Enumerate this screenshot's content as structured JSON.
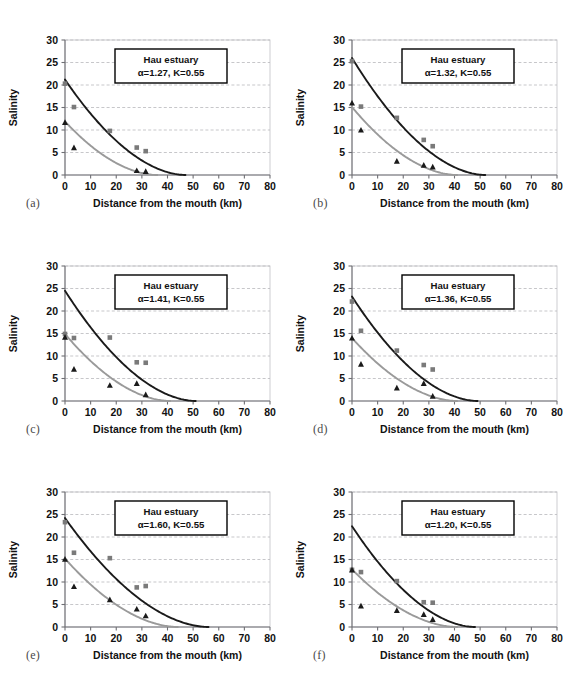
{
  "figure": {
    "title": "",
    "panel_count": 6,
    "background": "#ffffff"
  },
  "axes": {
    "xlabel": "Distance from the mouth (km)",
    "ylabel": "Salinity",
    "xticks": [
      0,
      10,
      20,
      30,
      40,
      50,
      60,
      70,
      80
    ],
    "yticks": [
      0,
      5,
      10,
      15,
      20,
      25,
      30
    ],
    "xlim": [
      0,
      80
    ],
    "ylim": [
      0,
      30
    ],
    "grid": "horizontal-dashed"
  },
  "legend": {
    "line1": "Hau estuary",
    "k_label": "K=0.55",
    "alpha_symbol": "α"
  },
  "colors": {
    "series_dark": "#1a1a1a",
    "series_light": "#9a9a9a",
    "grid": "#b9b9bc",
    "frame": "#c8c8cc",
    "axis": "#6f6f74",
    "text": "#111111"
  },
  "chart_data": [
    {
      "type": "scatter",
      "panel": "(a)",
      "title": "Hau estuary",
      "annotation": "α=1.27, K=0.55",
      "alpha": 1.27,
      "K": 0.55,
      "alpha_text": "=1.27, K=0.55",
      "xlabel": "Distance from the mouth (km)",
      "ylabel": "Salinity",
      "xlim": [
        0,
        80
      ],
      "ylim": [
        0,
        30
      ],
      "series": [
        {
          "name": "high-water slack (squares, dark)",
          "marker": "square",
          "color": "#7a7a7a",
          "points": [
            [
              0,
              20.3
            ],
            [
              3.5,
              15.1
            ],
            [
              17.5,
              9.8
            ],
            [
              28,
              6.1
            ],
            [
              31.5,
              5.3
            ]
          ]
        },
        {
          "name": "low-water slack (triangles, dark)",
          "marker": "triangle",
          "color": "#1a1a1a",
          "points": [
            [
              0,
              11.7
            ],
            [
              3.5,
              6.1
            ],
            [
              28,
              1.0
            ],
            [
              31.5,
              0.8
            ]
          ]
        }
      ],
      "curves": [
        {
          "name": "fitted-curve-dark",
          "color": "#1a1a1a",
          "s0": 21.2,
          "x_end": 47
        },
        {
          "name": "fitted-curve-light",
          "color": "#9a9a9a",
          "s0": 11.9,
          "x_end": 36
        }
      ]
    },
    {
      "type": "scatter",
      "panel": "(b)",
      "title": "Hau estuary",
      "annotation": "α=1.32, K=0.55",
      "alpha": 1.32,
      "K": 0.55,
      "alpha_text": "=1.32, K=0.55",
      "xlabel": "Distance from the mouth (km)",
      "ylabel": "Salinity",
      "xlim": [
        0,
        80
      ],
      "ylim": [
        0,
        30
      ],
      "series": [
        {
          "name": "high-water slack (squares, dark)",
          "marker": "square",
          "color": "#7a7a7a",
          "points": [
            [
              0,
              25.3
            ],
            [
              3.5,
              15.2
            ],
            [
              17.5,
              12.7
            ],
            [
              28,
              7.8
            ],
            [
              31.5,
              6.4
            ]
          ]
        },
        {
          "name": "low-water slack (triangles, dark)",
          "marker": "triangle",
          "color": "#1a1a1a",
          "points": [
            [
              0,
              16.0
            ],
            [
              3.5,
              10.0
            ],
            [
              17.5,
              3.1
            ],
            [
              28,
              2.2
            ],
            [
              31.5,
              1.8
            ]
          ]
        }
      ],
      "curves": [
        {
          "name": "fitted-curve-dark",
          "color": "#1a1a1a",
          "s0": 26.0,
          "x_end": 52
        },
        {
          "name": "fitted-curve-light",
          "color": "#9a9a9a",
          "s0": 15.1,
          "x_end": 41
        }
      ]
    },
    {
      "type": "scatter",
      "panel": "(c)",
      "title": "Hau estuary",
      "annotation": "α=1.41, K=0.55",
      "alpha": 1.41,
      "K": 0.55,
      "alpha_text": "=1.41, K=0.55",
      "xlabel": "Distance from the mouth (km)",
      "ylabel": "Salinity",
      "xlim": [
        0,
        80
      ],
      "ylim": [
        0,
        30
      ],
      "series": [
        {
          "name": "high-water slack (squares, dark)",
          "marker": "square",
          "color": "#7a7a7a",
          "points": [
            [
              0,
              14.9
            ],
            [
              3.5,
              14.0
            ],
            [
              17.5,
              14.1
            ],
            [
              28,
              8.6
            ],
            [
              31.5,
              8.5
            ]
          ]
        },
        {
          "name": "low-water slack (triangles, dark)",
          "marker": "triangle",
          "color": "#1a1a1a",
          "points": [
            [
              0,
              14.2
            ],
            [
              3.5,
              7.1
            ],
            [
              17.5,
              3.5
            ],
            [
              28,
              3.9
            ],
            [
              31.5,
              1.4
            ]
          ]
        }
      ],
      "curves": [
        {
          "name": "fitted-curve-dark",
          "color": "#1a1a1a",
          "s0": 24.5,
          "x_end": 51
        },
        {
          "name": "fitted-curve-light",
          "color": "#9a9a9a",
          "s0": 14.9,
          "x_end": 41
        }
      ]
    },
    {
      "type": "scatter",
      "panel": "(d)",
      "title": "Hau estuary",
      "annotation": "α=1.36, K=0.55",
      "alpha": 1.36,
      "K": 0.55,
      "alpha_text": "=1.36, K=0.55",
      "xlabel": "Distance from the mouth (km)",
      "ylabel": "Salinity",
      "xlim": [
        0,
        80
      ],
      "ylim": [
        0,
        30
      ],
      "series": [
        {
          "name": "high-water slack (squares, dark)",
          "marker": "square",
          "color": "#7a7a7a",
          "points": [
            [
              0,
              22.1
            ],
            [
              3.5,
              15.6
            ],
            [
              17.5,
              11.2
            ],
            [
              28,
              8.0
            ],
            [
              31.5,
              7.0
            ]
          ]
        },
        {
          "name": "low-water slack (triangles, dark)",
          "marker": "triangle",
          "color": "#1a1a1a",
          "points": [
            [
              0,
              14.0
            ],
            [
              3.5,
              8.2
            ],
            [
              17.5,
              2.9
            ],
            [
              28,
              3.9
            ],
            [
              31.5,
              1.1
            ]
          ]
        }
      ],
      "curves": [
        {
          "name": "fitted-curve-dark",
          "color": "#1a1a1a",
          "s0": 23.2,
          "x_end": 49
        },
        {
          "name": "fitted-curve-light",
          "color": "#9a9a9a",
          "s0": 14.0,
          "x_end": 41
        }
      ]
    },
    {
      "type": "scatter",
      "panel": "(e)",
      "title": "Hau estuary",
      "annotation": "α=1.60, K=0.55",
      "alpha": 1.6,
      "K": 0.55,
      "alpha_text": "=1.60, K=0.55",
      "xlabel": "Distance from the mouth (km)",
      "ylabel": "Salinity",
      "xlim": [
        0,
        80
      ],
      "ylim": [
        0,
        30
      ],
      "series": [
        {
          "name": "high-water slack (squares, dark)",
          "marker": "square",
          "color": "#7a7a7a",
          "points": [
            [
              0,
              23.3
            ],
            [
              3.5,
              16.5
            ],
            [
              17.5,
              15.3
            ],
            [
              28,
              8.8
            ],
            [
              31.5,
              9.1
            ]
          ]
        },
        {
          "name": "low-water slack (triangles, dark)",
          "marker": "triangle",
          "color": "#1a1a1a",
          "points": [
            [
              0,
              15.1
            ],
            [
              3.5,
              9.0
            ],
            [
              17.5,
              6.1
            ],
            [
              28,
              4.0
            ],
            [
              31.5,
              2.5
            ]
          ]
        }
      ],
      "curves": [
        {
          "name": "fitted-curve-dark",
          "color": "#1a1a1a",
          "s0": 24.2,
          "x_end": 56
        },
        {
          "name": "fitted-curve-light",
          "color": "#9a9a9a",
          "s0": 15.2,
          "x_end": 44
        }
      ]
    },
    {
      "type": "scatter",
      "panel": "(f)",
      "title": "Hau estuary",
      "annotation": "α=1.20, K=0.55",
      "alpha": 1.2,
      "K": 0.55,
      "alpha_text": "=1.20, K=0.55",
      "xlabel": "Distance from the mouth (km)",
      "ylabel": "Salinity",
      "xlim": [
        0,
        80
      ],
      "ylim": [
        0,
        30
      ],
      "series": [
        {
          "name": "high-water slack (squares, dark)",
          "marker": "square",
          "color": "#7a7a7a",
          "points": [
            [
              0,
              12.7
            ],
            [
              3.5,
              12.2
            ],
            [
              17.5,
              10.2
            ],
            [
              28,
              5.5
            ],
            [
              31.5,
              5.4
            ]
          ]
        },
        {
          "name": "low-water slack (triangles, dark)",
          "marker": "triangle",
          "color": "#1a1a1a",
          "points": [
            [
              0,
              12.7
            ],
            [
              3.5,
              4.7
            ],
            [
              17.5,
              3.7
            ],
            [
              28,
              2.8
            ],
            [
              31.5,
              1.7
            ]
          ]
        }
      ],
      "curves": [
        {
          "name": "fitted-curve-dark",
          "color": "#1a1a1a",
          "s0": 22.4,
          "x_end": 48
        },
        {
          "name": "fitted-curve-light",
          "color": "#9a9a9a",
          "s0": 12.8,
          "x_end": 41
        }
      ]
    }
  ]
}
